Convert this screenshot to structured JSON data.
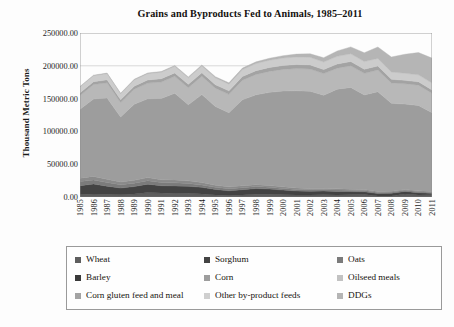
{
  "chart_data": {
    "type": "area",
    "title": "Grains and Byproducts Fed to Animals, 1985–2011",
    "xlabel": "",
    "ylabel": "Thousand Metric Tons",
    "ylim": [
      0,
      250000
    ],
    "ytick_labels": [
      "250000.00",
      "200000.00",
      "150000.00",
      "100000.00",
      "50000.00",
      "0.00"
    ],
    "ytick_values": [
      250000,
      200000,
      150000,
      100000,
      50000,
      0
    ],
    "grid": "horizontal-light",
    "legend_position": "below-plot",
    "stacked": true,
    "categories": [
      "1985",
      "1986",
      "1987",
      "1988",
      "1989",
      "1990",
      "1991",
      "1992",
      "1993",
      "1994",
      "1995",
      "1996",
      "1997",
      "1998",
      "1999",
      "2000",
      "2001",
      "2002",
      "2003",
      "2004",
      "2005",
      "2006",
      "2007",
      "2008",
      "2009",
      "2010",
      "2011"
    ],
    "series": [
      {
        "name": "Wheat",
        "color": "#5e5e5e",
        "values": [
          3800,
          4600,
          4100,
          3500,
          4400,
          6800,
          6200,
          5300,
          5600,
          4600,
          3200,
          2300,
          3100,
          4200,
          4100,
          3300,
          3000,
          3000,
          3400,
          3200,
          3300,
          3800,
          1600,
          1700,
          4400,
          3000,
          3500
        ]
      },
      {
        "name": "Sorghum",
        "color": "#434343",
        "values": [
          13500,
          15200,
          12400,
          10200,
          11500,
          12800,
          11000,
          11600,
          10800,
          10100,
          8300,
          7200,
          8100,
          8800,
          8100,
          7200,
          6200,
          5800,
          5600,
          5300,
          5000,
          4200,
          3600,
          4000,
          4100,
          3600,
          2100
        ]
      },
      {
        "name": "Oats",
        "color": "#7b7b7b",
        "values": [
          6200,
          6100,
          5600,
          5000,
          5200,
          5300,
          4800,
          4700,
          4200,
          3700,
          3300,
          3200,
          3000,
          2900,
          2600,
          2500,
          2300,
          2200,
          2100,
          2000,
          1900,
          1800,
          1700,
          1600,
          1600,
          1500,
          1400
        ]
      },
      {
        "name": "Barley",
        "color": "#8a8a8a",
        "values": [
          5200,
          5500,
          5000,
          4200,
          4300,
          4700,
          4300,
          4400,
          4000,
          3700,
          3100,
          2800,
          2900,
          2900,
          2700,
          2500,
          2300,
          2100,
          2000,
          1900,
          1800,
          1700,
          1600,
          1500,
          1500,
          1400,
          1300
        ]
      },
      {
        "name": "Corn",
        "color": "#9d9d9d",
        "values": [
          105000,
          118000,
          124000,
          99000,
          116000,
          120000,
          124000,
          132000,
          116000,
          134000,
          120000,
          113000,
          131000,
          137000,
          142000,
          146000,
          148000,
          148000,
          142000,
          152000,
          155000,
          144000,
          152000,
          134000,
          130000,
          130000,
          120000
        ]
      },
      {
        "name": "Oilseed meals",
        "color": "#b8b8b8",
        "values": [
          21000,
          22000,
          23000,
          22000,
          23000,
          24000,
          25000,
          26000,
          26000,
          28000,
          28000,
          28000,
          30000,
          31000,
          32000,
          33000,
          34000,
          34000,
          33000,
          32000,
          33000,
          33000,
          33000,
          31000,
          31000,
          31000,
          30000
        ]
      },
      {
        "name": "Corn gluten feed and meal",
        "color": "#a3a3a3",
        "values": [
          4100,
          4300,
          4500,
          4300,
          4600,
          4800,
          5000,
          5200,
          5100,
          5400,
          5400,
          5300,
          5600,
          5800,
          6000,
          6100,
          6200,
          6300,
          6200,
          6400,
          6500,
          6300,
          6200,
          5600,
          5200,
          5000,
          4800
        ]
      },
      {
        "name": "Other by-product feeds",
        "color": "#cccccc",
        "values": [
          9000,
          9200,
          9400,
          9100,
          9400,
          9600,
          9800,
          10000,
          9900,
          10200,
          10300,
          10200,
          10500,
          10800,
          11000,
          11200,
          11400,
          11500,
          11400,
          11600,
          11800,
          11600,
          11500,
          11000,
          10800,
          10700,
          10600
        ]
      },
      {
        "name": "DDGs",
        "color": "#b5b5b5",
        "values": [
          800,
          850,
          900,
          900,
          1000,
          1100,
          1200,
          1300,
          1400,
          1600,
          1800,
          2000,
          2300,
          2600,
          3000,
          3600,
          4400,
          5400,
          6600,
          8200,
          10500,
          13500,
          17500,
          23000,
          29000,
          34000,
          38000
        ]
      }
    ]
  },
  "legend": {
    "items": [
      {
        "label": "Wheat",
        "color": "#5e5e5e"
      },
      {
        "label": "Sorghum",
        "color": "#434343"
      },
      {
        "label": "Oats",
        "color": "#7b7b7b"
      },
      {
        "label": "Barley",
        "color": "#3a3a3a"
      },
      {
        "label": "Corn",
        "color": "#9d9d9d"
      },
      {
        "label": "Oilseed meals",
        "color": "#c2c2c2"
      },
      {
        "label": "Corn gluten feed and meal",
        "color": "#a3a3a3"
      },
      {
        "label": "Other by-product feeds",
        "color": "#cfcfcf"
      },
      {
        "label": "DDGs",
        "color": "#b5b5b5"
      }
    ]
  }
}
